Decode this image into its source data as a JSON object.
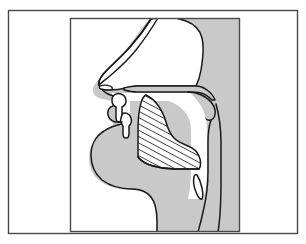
{
  "figure": {
    "title": "Mid-sagittal section of the human vocal tract",
    "caption": "",
    "view": "left-facing sagittal profile of head and neck",
    "frames": {
      "outer_frame_label": "outer border",
      "inner_frame_label": "illustration panel border"
    },
    "colors": {
      "background": "#ffffff",
      "page": "#ffffff",
      "tissue_fill": "#c9c9c9",
      "cavity_fill": "#ffffff",
      "outline": "#1a1a1a",
      "hatch_line": "#1a1a1a",
      "frame_line": "#3a3a3a"
    },
    "hatching": {
      "region": "tongue body",
      "style": "diagonal parallel lines",
      "angle_degrees": 60,
      "spacing_px": 4,
      "stroke_width_px": 1.4
    },
    "anatomy_parts": [
      {
        "id": "head-profile",
        "label": "Head and neck tissue profile",
        "fill": "tissue"
      },
      {
        "id": "nasal-cavity",
        "label": "Nasal cavity",
        "fill": "cavity"
      },
      {
        "id": "nostril",
        "label": "Nostril opening",
        "fill": "cavity"
      },
      {
        "id": "hard-palate",
        "label": "Hard palate",
        "fill": "tissue"
      },
      {
        "id": "soft-palate-velum",
        "label": "Soft palate (velum) and uvula",
        "fill": "tissue"
      },
      {
        "id": "upper-lip",
        "label": "Upper lip",
        "fill": "tissue"
      },
      {
        "id": "lower-lip",
        "label": "Lower lip",
        "fill": "tissue"
      },
      {
        "id": "upper-teeth",
        "label": "Upper teeth",
        "fill": "cavity"
      },
      {
        "id": "lower-teeth",
        "label": "Lower teeth",
        "fill": "cavity"
      },
      {
        "id": "oral-cavity",
        "label": "Oral cavity",
        "fill": "cavity"
      },
      {
        "id": "tongue",
        "label": "Tongue",
        "fill": "hatched"
      },
      {
        "id": "pharynx",
        "label": "Pharyngeal cavity",
        "fill": "cavity"
      },
      {
        "id": "epiglottis",
        "label": "Epiglottis / larynx",
        "fill": "cavity"
      },
      {
        "id": "back-wall",
        "label": "Posterior pharyngeal wall",
        "fill": "tissue"
      }
    ]
  }
}
